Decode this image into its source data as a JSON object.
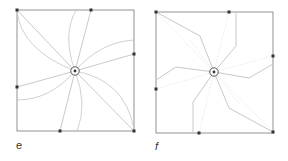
{
  "figure": {
    "panels": [
      {
        "id": "e",
        "label": "e",
        "style": "curved",
        "frame": {
          "x": 17,
          "y": 10,
          "w": 117,
          "h": 121
        },
        "center": {
          "x": 75,
          "y": 71
        },
        "anchors": [
          {
            "x": 17,
            "y": 10
          },
          {
            "x": 91,
            "y": 10
          },
          {
            "x": 134,
            "y": 54
          },
          {
            "x": 17,
            "y": 87
          },
          {
            "x": 60,
            "y": 131
          },
          {
            "x": 134,
            "y": 131
          }
        ]
      },
      {
        "id": "f",
        "label": "f",
        "style": "polyline",
        "frame": {
          "x": 156,
          "y": 12,
          "w": 117,
          "h": 121
        },
        "center": {
          "x": 214,
          "y": 72
        },
        "anchors": [
          {
            "x": 156,
            "y": 12
          },
          {
            "x": 229,
            "y": 12
          },
          {
            "x": 273,
            "y": 56
          },
          {
            "x": 156,
            "y": 89
          },
          {
            "x": 199,
            "y": 133
          },
          {
            "x": 273,
            "y": 132
          }
        ]
      }
    ],
    "colors": {
      "frame": "#777777",
      "line": "#bbbbbb",
      "faint": "#dddddd",
      "dot": "#333333"
    }
  }
}
